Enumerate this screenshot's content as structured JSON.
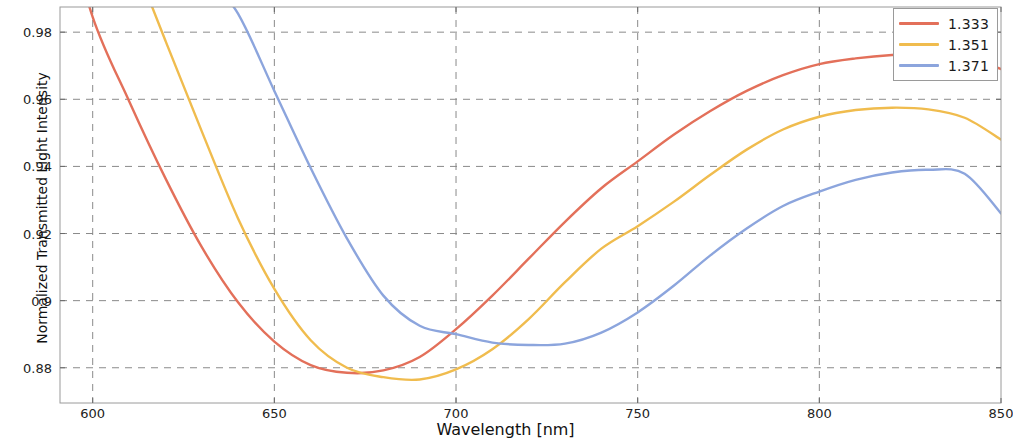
{
  "chart_data": {
    "type": "line",
    "title": "",
    "xlabel": "Wavelength [nm]",
    "ylabel": "Normalized Transmitted Light Intensity",
    "xlim": [
      591,
      850
    ],
    "ylim": [
      0.8695,
      0.9875
    ],
    "xticks": [
      600,
      650,
      700,
      750,
      800,
      850
    ],
    "yticks": [
      0.88,
      0.9,
      0.92,
      0.94,
      0.96,
      0.98
    ],
    "xtick_labels": [
      "600",
      "650",
      "700",
      "750",
      "800",
      "850"
    ],
    "ytick_labels": [
      "0.88",
      "0.9",
      "0.92",
      "0.94",
      "0.96",
      "0.98"
    ],
    "grid": true,
    "grid_style": "dashed",
    "legend_position": "top-right",
    "x": [
      591,
      600,
      610,
      620,
      630,
      640,
      650,
      660,
      670,
      680,
      690,
      700,
      710,
      720,
      730,
      740,
      750,
      760,
      770,
      780,
      790,
      800,
      810,
      820,
      830,
      840,
      850
    ],
    "series": [
      {
        "name": "1.333",
        "color": "#E3705A",
        "values": [
          1.02,
          0.9845,
          0.9595,
          0.9365,
          0.916,
          0.8995,
          0.8878,
          0.8808,
          0.8785,
          0.8792,
          0.8832,
          0.8915,
          0.9015,
          0.9125,
          0.9235,
          0.9335,
          0.9415,
          0.9495,
          0.9565,
          0.9625,
          0.9672,
          0.9705,
          0.9722,
          0.9732,
          0.9735,
          0.9728,
          0.969
        ]
      },
      {
        "name": "1.351",
        "color": "#F0BC4E",
        "values": [
          1.055,
          1.032,
          1.005,
          0.9775,
          0.9505,
          0.9245,
          0.9035,
          0.8882,
          0.88,
          0.8772,
          0.8765,
          0.8795,
          0.8855,
          0.8945,
          0.9055,
          0.9155,
          0.9222,
          0.9295,
          0.9375,
          0.945,
          0.951,
          0.9548,
          0.9568,
          0.9575,
          0.957,
          0.9545,
          0.948
        ]
      },
      {
        "name": "1.371",
        "color": "#8CA5DD",
        "values": [
          1.085,
          1.068,
          1.048,
          1.025,
          1.0,
          0.9855,
          0.9625,
          0.9395,
          0.9185,
          0.9015,
          0.8925,
          0.89,
          0.8875,
          0.8868,
          0.8872,
          0.8905,
          0.8965,
          0.9045,
          0.9135,
          0.9215,
          0.9282,
          0.9325,
          0.936,
          0.9382,
          0.939,
          0.9378,
          0.926
        ]
      }
    ]
  },
  "legend": {
    "items": [
      {
        "label": "1.333",
        "color": "#E3705A"
      },
      {
        "label": "1.351",
        "color": "#F0BC4E"
      },
      {
        "label": "1.371",
        "color": "#8CA5DD"
      }
    ]
  },
  "axes": {
    "x_axis_label": "Wavelength [nm]",
    "y_axis_label": "Normalized Transmitted Light Intensity"
  },
  "style": {
    "grid_color": "#8a8a8a",
    "axis_color": "#9a9a9a",
    "background": "#ffffff"
  }
}
